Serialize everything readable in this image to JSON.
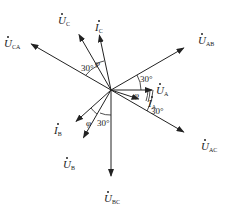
{
  "diagram": {
    "type": "phasor-diagram",
    "phasors": [
      {
        "id": "U_A",
        "symbol": "U",
        "subscript": "A",
        "kind": "voltage",
        "angle_deg": 0
      },
      {
        "id": "U_AB",
        "symbol": "U",
        "subscript": "AB",
        "kind": "voltage",
        "angle_deg": 30
      },
      {
        "id": "U_C",
        "symbol": "U",
        "subscript": "C",
        "kind": "voltage",
        "angle_deg": 120
      },
      {
        "id": "I_C",
        "symbol": "I",
        "subscript": "C",
        "kind": "current",
        "angle_deg": 102
      },
      {
        "id": "U_CA",
        "symbol": "U",
        "subscript": "CA",
        "kind": "voltage",
        "angle_deg": 150
      },
      {
        "id": "U_B",
        "symbol": "U",
        "subscript": "B",
        "kind": "voltage",
        "angle_deg": 240
      },
      {
        "id": "I_B",
        "symbol": "I",
        "subscript": "B",
        "kind": "current",
        "angle_deg": 222
      },
      {
        "id": "U_BC",
        "symbol": "U",
        "subscript": "BC",
        "kind": "voltage",
        "angle_deg": 270
      },
      {
        "id": "I_A",
        "symbol": "I",
        "subscript": "A",
        "kind": "current",
        "angle_deg": -18
      },
      {
        "id": "U_AC",
        "symbol": "U",
        "subscript": "AC",
        "kind": "voltage",
        "angle_deg": -30
      }
    ],
    "angle_labels": {
      "thirty": "30°",
      "phi": "φ"
    }
  }
}
